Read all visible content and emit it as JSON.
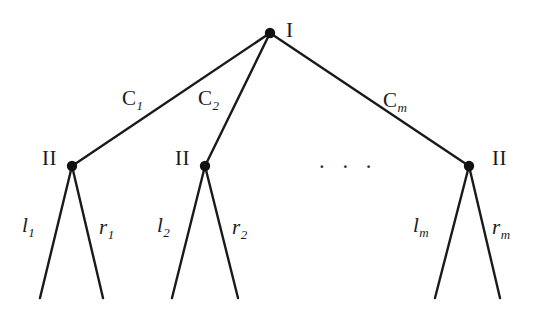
{
  "figure": {
    "type": "extensive-form-game-tree",
    "background_color": "#ffffff",
    "line_color": "#1a1a1a",
    "node_color": "#111111"
  },
  "root": {
    "player_label": "I",
    "x": 270,
    "y": 33
  },
  "ellipsis": {
    "text": "· · ·",
    "x": 318,
    "y": 155
  },
  "subtrees": [
    {
      "player_label": "II",
      "edge_label_base": "C",
      "edge_label_sub": "1",
      "left_leaf_base": "l",
      "left_leaf_sub": "1",
      "right_leaf_base": "r",
      "right_leaf_sub": "1",
      "node_x": 72,
      "node_y": 166,
      "left_end_x": 40,
      "right_end_x": 103,
      "leaf_end_y": 298,
      "player_label_x": 42,
      "player_label_y": 148,
      "edge_label_x": 122,
      "edge_label_y": 88,
      "left_leaf_x": 22,
      "left_leaf_y": 215,
      "right_leaf_x": 99,
      "right_leaf_y": 217
    },
    {
      "player_label": "II",
      "edge_label_base": "C",
      "edge_label_sub": "2",
      "left_leaf_base": "l",
      "left_leaf_sub": "2",
      "right_leaf_base": "r",
      "right_leaf_sub": "2",
      "node_x": 205,
      "node_y": 166,
      "left_end_x": 172,
      "right_end_x": 238,
      "leaf_end_y": 298,
      "player_label_x": 175,
      "player_label_y": 148,
      "edge_label_x": 198,
      "edge_label_y": 88,
      "left_leaf_x": 157,
      "left_leaf_y": 215,
      "right_leaf_x": 232,
      "right_leaf_y": 217
    },
    {
      "player_label": "II",
      "edge_label_base": "C",
      "edge_label_sub": "m",
      "left_leaf_base": "l",
      "left_leaf_sub": "m",
      "right_leaf_base": "r",
      "right_leaf_sub": "m",
      "node_x": 469,
      "node_y": 166,
      "left_end_x": 435,
      "right_end_x": 500,
      "leaf_end_y": 298,
      "player_label_x": 492,
      "player_label_y": 148,
      "edge_label_x": 383,
      "edge_label_y": 90,
      "left_leaf_x": 413,
      "left_leaf_y": 215,
      "right_leaf_x": 492,
      "right_leaf_y": 217
    }
  ]
}
